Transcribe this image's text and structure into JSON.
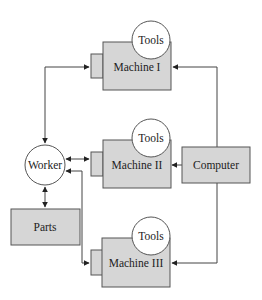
{
  "diagram": {
    "type": "flow",
    "colors": {
      "box_fill": "#d6d6d6",
      "stroke": "#555555",
      "circle_fill": "#ffffff",
      "line": "#444444"
    },
    "nodes": [
      {
        "id": "machine1",
        "label": "Machine I",
        "tools_label": "Tools"
      },
      {
        "id": "machine2",
        "label": "Machine II",
        "tools_label": "Tools"
      },
      {
        "id": "machine3",
        "label": "Machine III",
        "tools_label": "Tools"
      },
      {
        "id": "worker",
        "label": "Worker"
      },
      {
        "id": "parts",
        "label": "Parts"
      },
      {
        "id": "computer",
        "label": "Computer"
      }
    ],
    "edges": [
      {
        "from": "worker",
        "to": "machine1",
        "bidirectional": true
      },
      {
        "from": "worker",
        "to": "machine2",
        "bidirectional": true
      },
      {
        "from": "worker",
        "to": "machine3",
        "bidirectional": true
      },
      {
        "from": "worker",
        "to": "parts",
        "bidirectional": true
      },
      {
        "from": "computer",
        "to": "machine1",
        "bidirectional": false
      },
      {
        "from": "computer",
        "to": "machine2",
        "bidirectional": false
      },
      {
        "from": "computer",
        "to": "machine3",
        "bidirectional": false
      }
    ]
  }
}
